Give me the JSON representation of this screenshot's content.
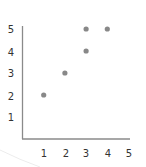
{
  "chart_data": {
    "type": "scatter",
    "title": "",
    "xlabel": "",
    "ylabel": "",
    "xlim": [
      0,
      5
    ],
    "ylim": [
      0,
      5
    ],
    "grid": false,
    "legend": null,
    "x_ticks": [
      "1",
      "2",
      "3",
      "4",
      "5"
    ],
    "y_ticks": [
      "1",
      "2",
      "3",
      "4",
      "5"
    ],
    "points": [
      {
        "x": 1,
        "y": 2
      },
      {
        "x": 2,
        "y": 3
      },
      {
        "x": 3,
        "y": 4
      },
      {
        "x": 3,
        "y": 5
      },
      {
        "x": 4,
        "y": 5
      }
    ],
    "colors": {
      "point": "#888888",
      "axis": "#8a8a8a",
      "text": "#333333"
    }
  }
}
